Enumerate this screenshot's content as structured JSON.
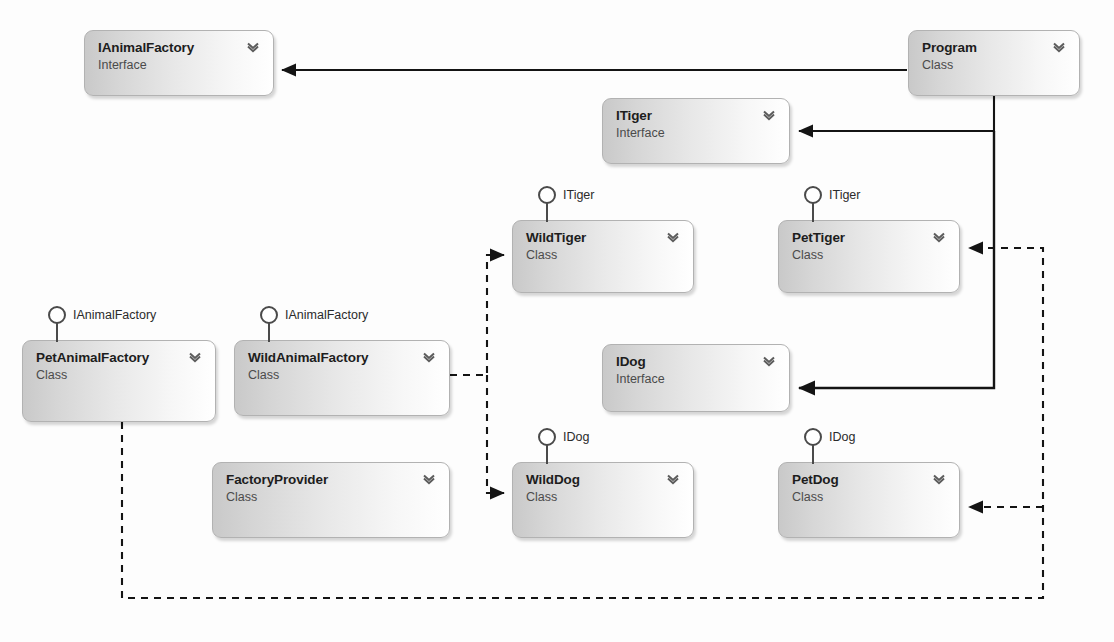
{
  "diagram": {
    "background_color": "#fdfdfd",
    "node_border_color": "#b2b2b2",
    "edge_color": "#1a1a1a"
  },
  "nodes": [
    {
      "id": "ianimalfactory",
      "name": "IAnimalFactory",
      "kind": "Interface",
      "x": 84,
      "y": 30,
      "w": 190,
      "h": 66,
      "expander": "chevron-down-icon"
    },
    {
      "id": "program",
      "name": "Program",
      "kind": "Class",
      "x": 908,
      "y": 30,
      "w": 172,
      "h": 66,
      "expander": "chevron-down-icon"
    },
    {
      "id": "itiger",
      "name": "ITiger",
      "kind": "Interface",
      "x": 602,
      "y": 98,
      "w": 188,
      "h": 66,
      "expander": "chevron-down-icon"
    },
    {
      "id": "wildtiger",
      "name": "WildTiger",
      "kind": "Class",
      "x": 512,
      "y": 220,
      "w": 182,
      "h": 73,
      "expander": "chevron-down-icon",
      "implements": "ITiger",
      "lollipop_x": 546,
      "lollipop_label_x": 563
    },
    {
      "id": "pettiger",
      "name": "PetTiger",
      "kind": "Class",
      "x": 778,
      "y": 220,
      "w": 182,
      "h": 73,
      "expander": "chevron-down-icon",
      "implements": "ITiger",
      "lollipop_x": 812,
      "lollipop_label_x": 829
    },
    {
      "id": "petanimalfactory",
      "name": "PetAnimalFactory",
      "kind": "Class",
      "x": 22,
      "y": 340,
      "w": 194,
      "h": 82,
      "expander": "chevron-down-icon",
      "implements": "IAnimalFactory",
      "lollipop_x": 56,
      "lollipop_label_x": 73
    },
    {
      "id": "wildanimalfactory",
      "name": "WildAnimalFactory",
      "kind": "Class",
      "x": 234,
      "y": 340,
      "w": 216,
      "h": 76,
      "expander": "chevron-down-icon",
      "implements": "IAnimalFactory",
      "lollipop_x": 268,
      "lollipop_label_x": 285
    },
    {
      "id": "idog",
      "name": "IDog",
      "kind": "Interface",
      "x": 602,
      "y": 344,
      "w": 188,
      "h": 68,
      "expander": "chevron-down-icon"
    },
    {
      "id": "factoryprovider",
      "name": "FactoryProvider",
      "kind": "Class",
      "x": 212,
      "y": 462,
      "w": 238,
      "h": 76,
      "expander": "chevron-down-icon"
    },
    {
      "id": "wilddog",
      "name": "WildDog",
      "kind": "Class",
      "x": 512,
      "y": 462,
      "w": 182,
      "h": 76,
      "expander": "chevron-down-icon",
      "implements": "IDog",
      "lollipop_x": 546,
      "lollipop_label_x": 563
    },
    {
      "id": "petdog",
      "name": "PetDog",
      "kind": "Class",
      "x": 778,
      "y": 462,
      "w": 182,
      "h": 76,
      "expander": "chevron-down-icon",
      "implements": "IDog",
      "lollipop_x": 812,
      "lollipop_label_x": 829
    }
  ],
  "edges": [
    {
      "id": "program-to-ianimalfactory",
      "style": "solid",
      "from": "program",
      "to": "ianimalfactory",
      "arrow": "filled-triangle"
    },
    {
      "id": "program-to-itiger",
      "style": "solid",
      "from": "program",
      "to": "itiger",
      "arrow": "filled-triangle"
    },
    {
      "id": "program-to-idog",
      "style": "solid",
      "from": "program",
      "to": "idog",
      "arrow": "filled-triangle"
    },
    {
      "id": "wildanimalfactory-to-wildtiger",
      "style": "dashed",
      "from": "wildanimalfactory",
      "to": "wildtiger",
      "arrow": "filled-triangle"
    },
    {
      "id": "wildanimalfactory-to-wilddog",
      "style": "dashed",
      "from": "wildanimalfactory",
      "to": "wilddog",
      "arrow": "filled-triangle"
    },
    {
      "id": "petanimalfactory-to-pettiger",
      "style": "dashed",
      "from": "petanimalfactory",
      "to": "pettiger",
      "arrow": "filled-triangle"
    },
    {
      "id": "petanimalfactory-to-petdog",
      "style": "dashed",
      "from": "petanimalfactory",
      "to": "petdog",
      "arrow": "filled-triangle"
    }
  ]
}
